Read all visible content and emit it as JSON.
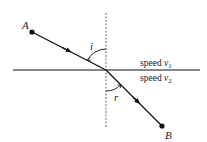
{
  "diagram": {
    "points": {
      "A": {
        "label": "A"
      },
      "B": {
        "label": "B"
      }
    },
    "angles": {
      "incidence": {
        "label": "i"
      },
      "refraction": {
        "label": "r"
      }
    },
    "media": {
      "upper": {
        "text": "speed ",
        "var": "v",
        "sub": "1"
      },
      "lower": {
        "text": "speed ",
        "var": "v",
        "sub": "2"
      }
    },
    "colors": {
      "line": "#111111",
      "normal": "#555555",
      "background": "#ffffff"
    }
  }
}
